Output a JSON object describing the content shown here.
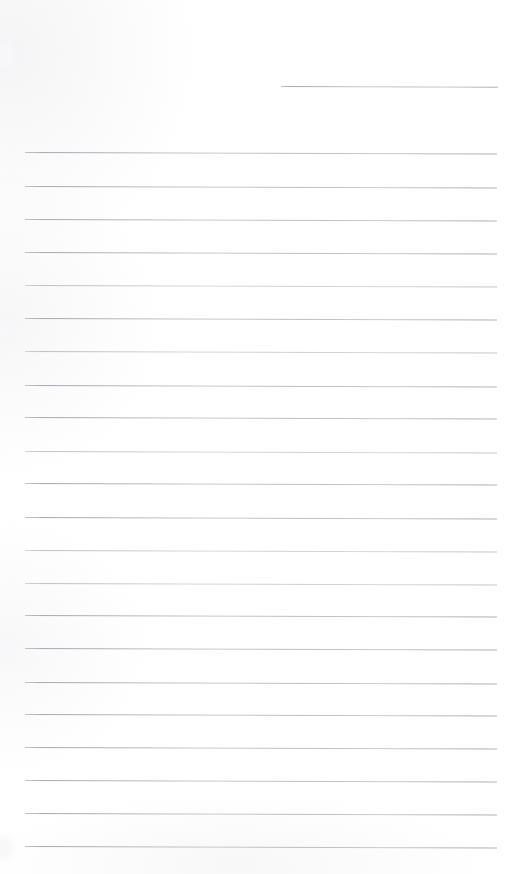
{
  "document": {
    "kind": "scanned-blank-lined-page",
    "title": "Blank Ruled Notebook Page",
    "page_width": 523,
    "page_height": 874,
    "background_color": "#ffffff",
    "rule_color": "#aaadb4",
    "rule_thickness_px": 1,
    "rule_spacing_px": 33,
    "rule_left_x": 25,
    "rule_right_x": 497,
    "skew_deg": 0.18,
    "content_text": "",
    "notes": "No handwriting, text, or printed characters are present on the page."
  },
  "rules": [
    {
      "id": "rule-partial-top",
      "y": 86,
      "x": 281,
      "width": 217,
      "weight": "dark",
      "partial": true
    },
    {
      "id": "rule-1",
      "y": 152,
      "x": 25,
      "width": 472,
      "weight": "dark",
      "partial": false
    },
    {
      "id": "rule-2",
      "y": 186,
      "x": 25,
      "width": 472,
      "weight": "dark",
      "partial": false
    },
    {
      "id": "rule-3",
      "y": 219,
      "x": 25,
      "width": 472,
      "weight": "dark",
      "partial": false
    },
    {
      "id": "rule-4",
      "y": 252,
      "x": 25,
      "width": 472,
      "weight": "dark",
      "partial": false
    },
    {
      "id": "rule-5",
      "y": 285,
      "x": 25,
      "width": 472,
      "weight": "faint",
      "partial": false
    },
    {
      "id": "rule-6",
      "y": 318,
      "x": 25,
      "width": 472,
      "weight": "dark",
      "partial": false
    },
    {
      "id": "rule-7",
      "y": 351,
      "x": 25,
      "width": 472,
      "weight": "faint",
      "partial": false
    },
    {
      "id": "rule-8",
      "y": 385,
      "x": 25,
      "width": 472,
      "weight": "dark",
      "partial": false
    },
    {
      "id": "rule-9",
      "y": 417,
      "x": 25,
      "width": 472,
      "weight": "dark",
      "partial": false
    },
    {
      "id": "rule-10",
      "y": 451,
      "x": 25,
      "width": 472,
      "weight": "faint",
      "partial": false
    },
    {
      "id": "rule-11",
      "y": 483,
      "x": 25,
      "width": 472,
      "weight": "dark",
      "partial": false
    },
    {
      "id": "rule-12",
      "y": 517,
      "x": 25,
      "width": 472,
      "weight": "dark",
      "partial": false
    },
    {
      "id": "rule-13",
      "y": 550,
      "x": 25,
      "width": 472,
      "weight": "faint",
      "partial": false
    },
    {
      "id": "rule-14",
      "y": 583,
      "x": 25,
      "width": 472,
      "weight": "faint",
      "partial": false
    },
    {
      "id": "rule-15",
      "y": 615,
      "x": 25,
      "width": 472,
      "weight": "dark",
      "partial": false
    },
    {
      "id": "rule-16",
      "y": 648,
      "x": 25,
      "width": 472,
      "weight": "dark",
      "partial": false
    },
    {
      "id": "rule-17",
      "y": 682,
      "x": 25,
      "width": 472,
      "weight": "dark",
      "partial": false
    },
    {
      "id": "rule-18",
      "y": 714,
      "x": 25,
      "width": 472,
      "weight": "dark",
      "partial": false
    },
    {
      "id": "rule-19",
      "y": 747,
      "x": 25,
      "width": 472,
      "weight": "dark",
      "partial": false
    },
    {
      "id": "rule-20",
      "y": 780,
      "x": 25,
      "width": 472,
      "weight": "dark",
      "partial": false
    },
    {
      "id": "rule-21",
      "y": 813,
      "x": 25,
      "width": 472,
      "weight": "dark",
      "partial": false
    },
    {
      "id": "rule-22",
      "y": 846,
      "x": 25,
      "width": 472,
      "weight": "dark",
      "partial": false
    }
  ],
  "smudges": [
    {
      "id": "smudge-top-left",
      "x": -6,
      "y": 42,
      "w": 22,
      "h": 26
    },
    {
      "id": "smudge-mid-left",
      "x": -8,
      "y": 318,
      "w": 20,
      "h": 24
    },
    {
      "id": "smudge-lower-left",
      "x": -8,
      "y": 640,
      "w": 20,
      "h": 26
    },
    {
      "id": "smudge-bottom-left",
      "x": -6,
      "y": 836,
      "w": 20,
      "h": 24
    }
  ]
}
